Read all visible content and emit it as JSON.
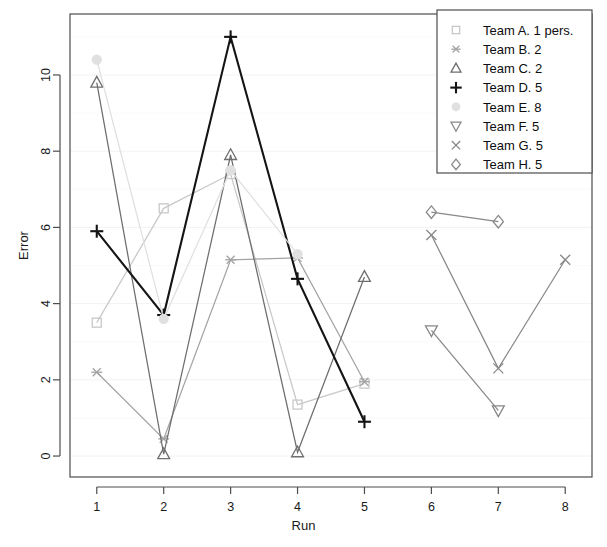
{
  "chart_data": {
    "type": "line",
    "title": "",
    "xlabel": "Run",
    "ylabel": "Error",
    "xlim": [
      0.6,
      8.4
    ],
    "ylim": [
      -0.55,
      11.6
    ],
    "xticks": [
      1,
      2,
      3,
      4,
      5,
      6,
      7,
      8
    ],
    "yticks": [
      0,
      2,
      4,
      6,
      8,
      10
    ],
    "grid": true,
    "legend_position": "top-right",
    "series": [
      {
        "name": "Team A. 1 pers.",
        "label": "Team A. 1 pers.",
        "marker": "square",
        "color": "#c8c8c8",
        "x": [
          1,
          2,
          3,
          4,
          5
        ],
        "values": [
          3.5,
          6.5,
          7.4,
          1.35,
          1.9
        ]
      },
      {
        "name": "Team B. 2",
        "label": "Team B. 2",
        "marker": "asterisk",
        "color": "#a3a3a3",
        "x": [
          1,
          2,
          3,
          4,
          5
        ],
        "values": [
          2.2,
          0.45,
          5.15,
          5.2,
          1.95
        ]
      },
      {
        "name": "Team C. 2",
        "label": "Team C. 2",
        "marker": "triangle-up",
        "color": "#6e6e6e",
        "x": [
          1,
          2,
          3,
          4,
          5
        ],
        "values": [
          9.8,
          0.05,
          7.9,
          0.1,
          4.7
        ]
      },
      {
        "name": "Team D. 5",
        "label": "Team D. 5",
        "marker": "plus",
        "color": "#141414",
        "x": [
          1,
          2,
          3,
          4,
          5
        ],
        "values": [
          5.9,
          3.7,
          11.0,
          4.65,
          0.9
        ]
      },
      {
        "name": "Team E. 8",
        "label": "Team E. 8",
        "marker": "circle",
        "color": "#e0e0e0",
        "x": [
          1,
          2,
          3,
          4
        ],
        "values": [
          10.4,
          3.6,
          7.5,
          5.3
        ]
      },
      {
        "name": "Team F. 5",
        "label": "Team F. 5",
        "marker": "triangle-down",
        "color": "#888888",
        "x": [
          6,
          7
        ],
        "values": [
          3.3,
          1.2
        ]
      },
      {
        "name": "Team G. 5",
        "label": "Team G. 5",
        "marker": "cross",
        "color": "#888888",
        "x": [
          6,
          7,
          8
        ],
        "values": [
          5.8,
          2.3,
          5.15
        ]
      },
      {
        "name": "Team H. 5",
        "label": "Team H. 5",
        "marker": "diamond",
        "color": "#888888",
        "x": [
          6,
          7
        ],
        "values": [
          6.4,
          6.15
        ]
      }
    ]
  },
  "axes": {
    "x_title": "Run",
    "y_title": "Error",
    "x_tick_labels": [
      "1",
      "2",
      "3",
      "4",
      "5",
      "6",
      "7",
      "8"
    ],
    "y_tick_labels": [
      "0",
      "2",
      "4",
      "6",
      "8",
      "10"
    ]
  },
  "legend": {
    "entries": [
      {
        "label": "Team A. 1 pers.",
        "marker": "square",
        "color": "#c8c8c8"
      },
      {
        "label": "Team B. 2",
        "marker": "asterisk",
        "color": "#a3a3a3"
      },
      {
        "label": "Team C. 2",
        "marker": "triangle-up",
        "color": "#6e6e6e"
      },
      {
        "label": "Team D. 5",
        "marker": "plus",
        "color": "#141414"
      },
      {
        "label": "Team E. 8",
        "marker": "circle",
        "color": "#e0e0e0"
      },
      {
        "label": "Team F. 5",
        "marker": "triangle-down",
        "color": "#888888"
      },
      {
        "label": "Team G. 5",
        "marker": "cross",
        "color": "#888888"
      },
      {
        "label": "Team H. 5",
        "marker": "diamond",
        "color": "#888888"
      }
    ]
  },
  "colors": {
    "frame": "#4d4d4d",
    "grid": "#f2f2f2",
    "text": "#1a1a1a",
    "background": "#ffffff"
  }
}
